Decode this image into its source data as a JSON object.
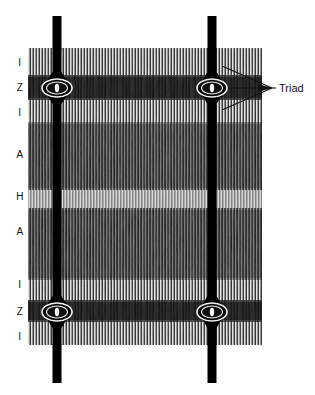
{
  "figure": {
    "background_color": "#ffffff",
    "ink_color": "#111111",
    "fiber": {
      "left": 28,
      "right": 262,
      "top": 48,
      "bottom": 345
    },
    "band_labels": [
      {
        "text": "I",
        "y": 63
      },
      {
        "text": "Z",
        "y": 88
      },
      {
        "text": "I",
        "y": 113
      },
      {
        "text": "A",
        "y": 155
      },
      {
        "text": "H",
        "y": 197
      },
      {
        "text": "A",
        "y": 232
      },
      {
        "text": "I",
        "y": 285
      },
      {
        "text": "Z",
        "y": 312
      },
      {
        "text": "I",
        "y": 337
      }
    ],
    "bands": [
      {
        "name": "I",
        "y": 48,
        "height": 27,
        "tone": "light"
      },
      {
        "name": "Z",
        "y": 75,
        "height": 25,
        "tone": "dark"
      },
      {
        "name": "I",
        "y": 100,
        "height": 22,
        "tone": "light"
      },
      {
        "name": "A",
        "y": 122,
        "height": 68,
        "tone": "dark"
      },
      {
        "name": "H",
        "y": 190,
        "height": 18,
        "tone": "light"
      },
      {
        "name": "A",
        "y": 208,
        "height": 72,
        "tone": "dark"
      },
      {
        "name": "I",
        "y": 280,
        "height": 20,
        "tone": "light"
      },
      {
        "name": "Z",
        "y": 300,
        "height": 22,
        "tone": "dark"
      },
      {
        "name": "I",
        "y": 322,
        "height": 23,
        "tone": "light"
      }
    ],
    "t_tubules": [
      {
        "x": 57,
        "width": 9,
        "top": 16,
        "bottom": 383
      },
      {
        "x": 212,
        "width": 9,
        "top": 16,
        "bottom": 383
      }
    ],
    "triads": [
      {
        "cx": 57,
        "cy": 88,
        "rx": 15,
        "ry": 9
      },
      {
        "cx": 212,
        "cy": 88,
        "rx": 15,
        "ry": 9
      },
      {
        "cx": 57,
        "cy": 312,
        "rx": 15,
        "ry": 9
      },
      {
        "cx": 212,
        "cy": 312,
        "rx": 15,
        "ry": 9
      }
    ],
    "callout": {
      "label": "Triad",
      "label_x": 279,
      "label_y": 92,
      "converge_x": 272,
      "converge_y": 88,
      "leader_targets": [
        {
          "x": 220,
          "y": 68
        },
        {
          "x": 225,
          "y": 88
        },
        {
          "x": 220,
          "y": 108
        }
      ]
    }
  }
}
